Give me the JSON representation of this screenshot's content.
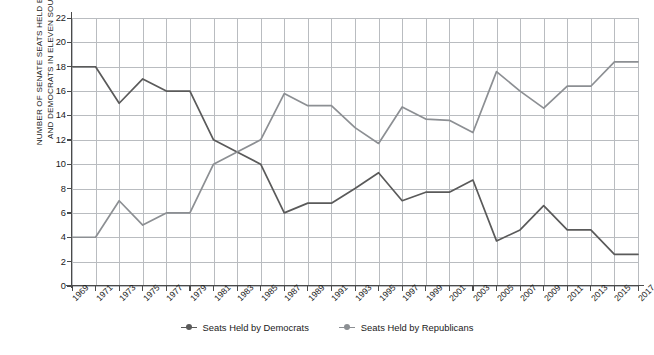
{
  "chart_data": {
    "type": "line",
    "title": "",
    "xlabel": "",
    "ylabel": "NUMBER OF SENATE SEATS HELD BY REPUBLICANS\nAND DEMOCRATS IN ELEVEN SOUTHERN STATES",
    "ylim": [
      0,
      22
    ],
    "ytick_step": 2,
    "yticks": [
      0,
      2,
      4,
      6,
      8,
      10,
      12,
      14,
      16,
      18,
      20,
      22
    ],
    "grid": true,
    "legend_position": "bottom-center",
    "categories": [
      "1969",
      "1971",
      "1973",
      "1975",
      "1977",
      "1979",
      "1981",
      "1983",
      "1985",
      "1987",
      "1989",
      "1991",
      "1993",
      "1995",
      "1997",
      "1999",
      "2001",
      "2003",
      "2005",
      "2007",
      "2009",
      "2011",
      "2013",
      "2015",
      "2017"
    ],
    "series": [
      {
        "name": "Seats Held by Democrats",
        "color": "#5a5a5a",
        "values": [
          18,
          18,
          15,
          17,
          16,
          16,
          12,
          11,
          10,
          6,
          6.8,
          6.8,
          8,
          9.3,
          7,
          7.7,
          7.7,
          8.7,
          3.7,
          4.6,
          6.6,
          4.6,
          4.6,
          2.6,
          2.6
        ]
      },
      {
        "name": "Seats Held by Republicans",
        "color": "#8c8f93",
        "values": [
          4,
          4,
          7,
          5,
          6,
          6,
          10,
          11,
          12,
          15.8,
          14.8,
          14.8,
          13,
          11.7,
          14.7,
          13.7,
          13.6,
          12.6,
          17.6,
          16,
          14.6,
          16.4,
          16.4,
          18.4,
          18.4
        ]
      }
    ]
  },
  "legend": {
    "items": [
      {
        "label": "Seats Held by Democrats",
        "color": "#5a5a5a"
      },
      {
        "label": "Seats Held by Republicans",
        "color": "#8c8f93"
      }
    ]
  },
  "colors": {
    "democrat": "#5a5a5a",
    "republican": "#8c8f93",
    "grid": "#b9bcc0",
    "axis": "#4a4a4a",
    "text": "#1a1a1a",
    "background": "#ffffff"
  }
}
